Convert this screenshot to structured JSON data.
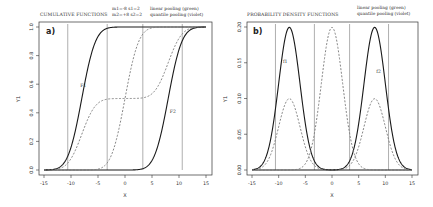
{
  "chart_data": [
    {
      "type": "line",
      "panel_label": "a)",
      "title": "CUMULATIVE FUNCTIONS",
      "legend": {
        "params_line1": "m1=-8   s1=2",
        "params_line2": "m2=+8   s2=2",
        "pooling_line1": "linear pooling (green)",
        "pooling_line2": "quantile pooling (violet)"
      },
      "xlabel": "X",
      "ylabel": "Y1",
      "xlim": [
        -15,
        15
      ],
      "ylim": [
        0,
        1
      ],
      "xticks": [
        "-15",
        "-10",
        "-5",
        "0",
        "5",
        "10",
        "15"
      ],
      "yticks": [
        "0.0",
        "0.2",
        "0.4",
        "0.6",
        "0.8",
        "1.0"
      ],
      "vertical_lines_x": [
        -10.6,
        -3.3,
        3.3,
        10.6
      ],
      "curve_labels": [
        {
          "text": "F1",
          "x": -8.3,
          "y": 0.58
        },
        {
          "text": "F2",
          "x": 8.3,
          "y": 0.4
        }
      ],
      "series": [
        {
          "name": "F1",
          "style": "solid",
          "dist": "normal_cdf",
          "mean": -8,
          "sd": 2
        },
        {
          "name": "F2",
          "style": "solid",
          "dist": "normal_cdf",
          "mean": 8,
          "sd": 2
        },
        {
          "name": "linear pooling",
          "style": "dashed",
          "dist": "mixture_cdf",
          "weights": [
            0.5,
            0.5
          ]
        },
        {
          "name": "quantile pooling",
          "style": "dashed",
          "dist": "normal_cdf",
          "mean": 0,
          "sd": 2
        }
      ]
    },
    {
      "type": "line",
      "panel_label": "b)",
      "title": "PROBABILITY DENSITY FUNCTIONS",
      "legend": {
        "pooling_line1": "linear pooling (green)",
        "pooling_line2": "quantile pooling (violet)"
      },
      "xlabel": "X",
      "ylabel": "Y1",
      "xlim": [
        -15,
        15
      ],
      "ylim": [
        0,
        0.2
      ],
      "xticks": [
        "-15",
        "-10",
        "-5",
        "0",
        "5",
        "10",
        "15"
      ],
      "yticks": [
        "0.00",
        "0.05",
        "0.10",
        "0.15",
        "0.20"
      ],
      "vertical_lines_x": [
        -10.6,
        -3.3,
        3.3,
        10.6
      ],
      "curve_labels": [
        {
          "text": "f1",
          "x": -9.2,
          "y": 0.15
        },
        {
          "text": "f2",
          "x": 8.3,
          "y": 0.135
        }
      ],
      "series": [
        {
          "name": "f1",
          "style": "solid",
          "dist": "normal_pdf",
          "mean": -8,
          "sd": 2
        },
        {
          "name": "f2",
          "style": "solid",
          "dist": "normal_pdf",
          "mean": 8,
          "sd": 2
        },
        {
          "name": "linear pooling",
          "style": "dashed",
          "dist": "mixture_pdf",
          "weights": [
            0.5,
            0.5
          ]
        },
        {
          "name": "quantile pooling",
          "style": "dashed",
          "dist": "normal_pdf",
          "mean": 0,
          "sd": 2
        }
      ]
    }
  ]
}
